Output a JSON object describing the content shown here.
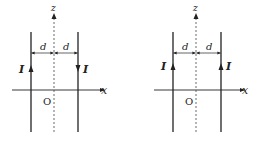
{
  "diagrams": [
    {
      "id": "left",
      "axis_z_label": "z",
      "axis_x_label": "x",
      "origin_label": "O",
      "distance_label_left": "d",
      "distance_label_right": "d",
      "wire_left": {
        "current_label": "I",
        "direction": "up"
      },
      "wire_right": {
        "current_label": "I",
        "direction": "down"
      }
    },
    {
      "id": "right",
      "axis_z_label": "z",
      "axis_x_label": "x",
      "origin_label": "O",
      "distance_label_left": "d",
      "distance_label_right": "d",
      "wire_left": {
        "current_label": "I",
        "direction": "up"
      },
      "wire_right": {
        "current_label": "I",
        "direction": "up"
      }
    }
  ],
  "colors": {
    "line": "#222222",
    "dashed": "#444444"
  }
}
